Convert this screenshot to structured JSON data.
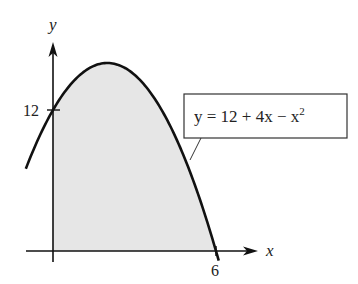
{
  "chart_data": {
    "type": "area",
    "title": "",
    "xlabel": "x",
    "ylabel": "y",
    "function": "y = 12 + 4x - x^2",
    "annotation": {
      "text_main": "y = 12 + 4x − x",
      "text_exp": "2"
    },
    "x_ticks": [
      {
        "value": 6,
        "label": "6"
      }
    ],
    "y_ticks": [
      {
        "value": 12,
        "label": "12"
      }
    ],
    "shaded_region": {
      "x_from": 0,
      "x_to": 6,
      "description": "area under curve between x=0 and x=6"
    },
    "curve_domain": [
      -1,
      6.1
    ],
    "xlim": [
      -1,
      7.5
    ],
    "ylim": [
      -1,
      18
    ],
    "grid": false,
    "x": [
      -1,
      0,
      1,
      2,
      3,
      4,
      5,
      6
    ],
    "values": [
      7,
      12,
      15,
      16,
      15,
      12,
      7,
      0
    ],
    "colors": {
      "curve": "#111111",
      "fill": "#e6e6e6",
      "axis": "#111111",
      "box_border": "#333333"
    }
  }
}
